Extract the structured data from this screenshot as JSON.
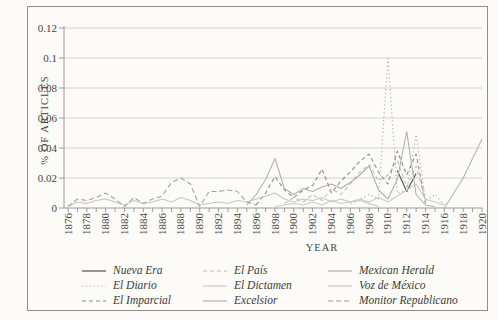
{
  "figure": {
    "y_axis_title": "% OF ARTICLES",
    "x_axis_title": "YEAR"
  },
  "chart_data": {
    "type": "line",
    "title": "",
    "xlabel": "YEAR",
    "ylabel": "% OF ARTICLES",
    "xlim": [
      1876,
      1920
    ],
    "ylim": [
      0,
      0.12
    ],
    "y_ticks": [
      0,
      0.02,
      0.04,
      0.06,
      0.08,
      0.1,
      0.12
    ],
    "y_tick_labels": [
      "0",
      "0.02",
      "0.04",
      "0.06",
      "0.08",
      "0.1",
      "0.12"
    ],
    "x_tick_labels": [
      "1876",
      "1878",
      "1880",
      "1882",
      "1884",
      "1886",
      "1888",
      "1890",
      "1892",
      "1894",
      "1896",
      "1898",
      "1900",
      "1902",
      "1904",
      "1906",
      "1908",
      "1910",
      "1912",
      "1914",
      "1916",
      "1918",
      "1920"
    ],
    "grid": "horizontal",
    "legend_position": "bottom",
    "series": [
      {
        "name": "Nueva Era",
        "color": "#4f4f4d",
        "dash": "",
        "points": [
          [
            1911,
            0.025
          ],
          [
            1912,
            0.011
          ],
          [
            1913,
            0.023
          ]
        ]
      },
      {
        "name": "El Diario",
        "color": "#b2b2b0",
        "dash": "1.3,2.6",
        "points": [
          [
            1906,
            0.003
          ],
          [
            1907,
            0.006
          ],
          [
            1908,
            0.009
          ],
          [
            1909,
            0.006
          ],
          [
            1910,
            0.101
          ],
          [
            1911,
            0.01
          ],
          [
            1912,
            0.012
          ],
          [
            1913,
            0.049
          ],
          [
            1914,
            0.005
          ],
          [
            1915,
            0.009
          ],
          [
            1916,
            0.002
          ]
        ]
      },
      {
        "name": "El Imparcial",
        "color": "#8e8e8c",
        "dash": "4,3",
        "points": [
          [
            1896,
            0.002
          ],
          [
            1897,
            0.01
          ],
          [
            1898,
            0.021
          ],
          [
            1899,
            0.012
          ],
          [
            1900,
            0.007
          ],
          [
            1901,
            0.012
          ],
          [
            1902,
            0.015
          ],
          [
            1903,
            0.026
          ],
          [
            1904,
            0.01
          ],
          [
            1905,
            0.018
          ],
          [
            1906,
            0.024
          ],
          [
            1907,
            0.031
          ],
          [
            1908,
            0.036
          ],
          [
            1909,
            0.024
          ],
          [
            1910,
            0.016
          ],
          [
            1911,
            0.038
          ],
          [
            1912,
            0.022
          ],
          [
            1913,
            0.036
          ],
          [
            1914,
            0.003
          ]
        ]
      },
      {
        "name": "El País",
        "color": "#bfbfbd",
        "dash": "4,3",
        "points": [
          [
            1899,
            0.003
          ],
          [
            1900,
            0.007
          ],
          [
            1901,
            0.004
          ],
          [
            1902,
            0.009
          ],
          [
            1903,
            0.005
          ],
          [
            1904,
            0.013
          ],
          [
            1905,
            0.009
          ],
          [
            1906,
            0.016
          ],
          [
            1907,
            0.024
          ],
          [
            1908,
            0.029
          ],
          [
            1909,
            0.018
          ],
          [
            1910,
            0.022
          ],
          [
            1911,
            0.032
          ],
          [
            1912,
            0.014
          ],
          [
            1913,
            0.028
          ],
          [
            1914,
            0.005
          ]
        ]
      },
      {
        "name": "El Dictamen",
        "color": "#cacac8",
        "dash": "",
        "points": [
          [
            1898,
            0.001
          ],
          [
            1899,
            0.002
          ],
          [
            1900,
            0.003
          ],
          [
            1901,
            0.002
          ],
          [
            1902,
            0.004
          ],
          [
            1903,
            0.002
          ],
          [
            1904,
            0.005
          ],
          [
            1905,
            0.003
          ],
          [
            1906,
            0.004
          ],
          [
            1907,
            0.006
          ],
          [
            1908,
            0.004
          ],
          [
            1909,
            0.007
          ],
          [
            1910,
            0.004
          ],
          [
            1911,
            0.008
          ],
          [
            1912,
            0.012
          ],
          [
            1913,
            0.016
          ],
          [
            1914,
            0.006
          ],
          [
            1915,
            0.004
          ],
          [
            1916,
            0.002
          ]
        ]
      },
      {
        "name": "Excelsior",
        "color": "#b6b6b4",
        "dash": "",
        "points": [
          [
            1916,
            0
          ],
          [
            1917,
            0.01
          ],
          [
            1918,
            0.02
          ],
          [
            1919,
            0.033
          ],
          [
            1920,
            0.046
          ]
        ]
      },
      {
        "name": "Mexican Herald",
        "color": "#b1b1af",
        "dash": "",
        "points": [
          [
            1895,
            0.002
          ],
          [
            1896,
            0.009
          ],
          [
            1897,
            0.019
          ],
          [
            1898,
            0.033
          ],
          [
            1899,
            0.013
          ],
          [
            1900,
            0.009
          ],
          [
            1901,
            0.013
          ],
          [
            1902,
            0.011
          ],
          [
            1903,
            0.014
          ],
          [
            1904,
            0.016
          ],
          [
            1905,
            0.013
          ],
          [
            1906,
            0.017
          ],
          [
            1907,
            0.022
          ],
          [
            1908,
            0.028
          ],
          [
            1909,
            0.012
          ],
          [
            1910,
            0.006
          ],
          [
            1911,
            0.019
          ],
          [
            1912,
            0.051
          ],
          [
            1913,
            0.009
          ],
          [
            1914,
            0.002
          ],
          [
            1915,
            0.001
          ]
        ]
      },
      {
        "name": "Voz de México",
        "color": "#c6c6c4",
        "dash": "",
        "points": [
          [
            1876,
            0.001
          ],
          [
            1877,
            0.004
          ],
          [
            1878,
            0.003
          ],
          [
            1879,
            0.005
          ],
          [
            1880,
            0.006
          ],
          [
            1881,
            0.004
          ],
          [
            1882,
            0.002
          ],
          [
            1883,
            0.005
          ],
          [
            1884,
            0.003
          ],
          [
            1885,
            0.004
          ],
          [
            1886,
            0.006
          ],
          [
            1887,
            0.004
          ],
          [
            1888,
            0.007
          ],
          [
            1889,
            0.005
          ],
          [
            1890,
            0.002
          ],
          [
            1891,
            0.003
          ],
          [
            1892,
            0.004
          ],
          [
            1893,
            0.003
          ],
          [
            1894,
            0.005
          ],
          [
            1895,
            0.004
          ],
          [
            1896,
            0.006
          ],
          [
            1897,
            0.008
          ],
          [
            1898,
            0.01
          ],
          [
            1899,
            0.006
          ],
          [
            1900,
            0.004
          ],
          [
            1901,
            0.006
          ],
          [
            1902,
            0.005
          ],
          [
            1903,
            0.007
          ],
          [
            1904,
            0.004
          ],
          [
            1905,
            0.006
          ],
          [
            1906,
            0.004
          ],
          [
            1907,
            0.005
          ],
          [
            1908,
            0.003
          ],
          [
            1909,
            0.001
          ]
        ]
      },
      {
        "name": "Monitor Republicano",
        "color": "#a3a3a1",
        "dash": "5,3",
        "points": [
          [
            1876,
            0.001
          ],
          [
            1877,
            0.006
          ],
          [
            1878,
            0.005
          ],
          [
            1879,
            0.007
          ],
          [
            1880,
            0.01
          ],
          [
            1881,
            0.006
          ],
          [
            1882,
            0.001
          ],
          [
            1883,
            0.007
          ],
          [
            1884,
            0.003
          ],
          [
            1885,
            0.006
          ],
          [
            1886,
            0.008
          ],
          [
            1887,
            0.017
          ],
          [
            1888,
            0.02
          ],
          [
            1889,
            0.016
          ],
          [
            1890,
            0.001
          ],
          [
            1891,
            0.011
          ],
          [
            1892,
            0.011
          ],
          [
            1893,
            0.012
          ],
          [
            1894,
            0.011
          ],
          [
            1895,
            0.004
          ],
          [
            1896,
            0.002
          ]
        ]
      }
    ]
  }
}
